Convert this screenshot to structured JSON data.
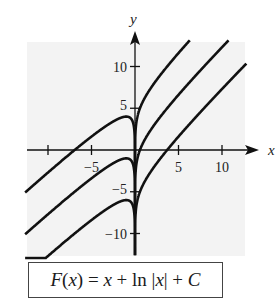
{
  "chart_data": {
    "type": "line",
    "title": "",
    "formula": "F(x) = x + ln |x| + C",
    "xlabel": "x",
    "ylabel": "y",
    "xlim": [
      -12.5,
      12.5
    ],
    "ylim": [
      -12.5,
      12.5
    ],
    "xticks": [
      -10,
      -5,
      5,
      10
    ],
    "xtick_labels": [
      "-5",
      "5",
      "10"
    ],
    "yticks": [
      -10,
      -5,
      5,
      10
    ],
    "ytick_labels": [
      "10",
      "5",
      "-5",
      "-10"
    ],
    "grid": false,
    "background": "#f3f3f3",
    "line_color": "#111111",
    "series": [
      {
        "name": "C = 5",
        "C": 5,
        "function": "x + ln|x| + 5",
        "left_branch_max": [
          -1,
          4
        ]
      },
      {
        "name": "C = 0",
        "C": 0,
        "function": "x + ln|x|",
        "left_branch_max": [
          -1,
          -1
        ]
      },
      {
        "name": "C = -5",
        "C": -5,
        "function": "x + ln|x| - 5",
        "left_branch_max": [
          -1,
          -6
        ]
      }
    ]
  },
  "labels": {
    "x_axis": "x",
    "y_axis": "y",
    "x_ticks": [
      {
        "value": -5,
        "text": "−5"
      },
      {
        "value": 5,
        "text": "5"
      },
      {
        "value": 10,
        "text": "10"
      }
    ],
    "y_ticks": [
      {
        "value": 10,
        "text": "10"
      },
      {
        "value": 5,
        "text": "5"
      },
      {
        "value": -5,
        "text": "−5"
      },
      {
        "value": -10,
        "text": "−10"
      }
    ]
  },
  "formula": {
    "F": "F",
    "open": "(",
    "x": "x",
    "close": ")",
    "eq": " = ",
    "x2": "x",
    "plus_ln": " + ln |",
    "x3": "x",
    "bar_plus": "| + ",
    "C": "C"
  }
}
